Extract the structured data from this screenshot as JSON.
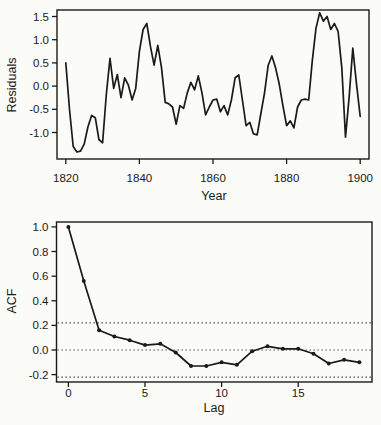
{
  "figure": {
    "background": "#fbfbf8",
    "ink_color": "#1a1a1a"
  },
  "chart_data": [
    {
      "type": "line",
      "panel": "top",
      "title": "",
      "xlabel": "Year",
      "ylabel": "Residuals",
      "x_start": 1820,
      "x_step": 1,
      "x_end": 1900,
      "values": [
        0.5,
        -0.5,
        -1.3,
        -1.42,
        -1.4,
        -1.25,
        -0.88,
        -0.63,
        -0.68,
        -1.15,
        -1.22,
        -0.18,
        0.6,
        -0.05,
        0.25,
        -0.25,
        0.18,
        0.02,
        -0.3,
        -0.05,
        0.75,
        1.22,
        1.35,
        0.85,
        0.45,
        0.88,
        0.4,
        -0.35,
        -0.38,
        -0.45,
        -0.82,
        -0.42,
        -0.48,
        -0.15,
        0.08,
        -0.08,
        0.22,
        -0.15,
        -0.62,
        -0.45,
        -0.3,
        -0.28,
        -0.55,
        -0.42,
        -0.62,
        -0.3,
        0.18,
        0.24,
        -0.3,
        -0.85,
        -0.78,
        -1.03,
        -1.05,
        -0.6,
        -0.15,
        0.45,
        0.65,
        0.4,
        0.05,
        -0.42,
        -0.85,
        -0.75,
        -0.9,
        -0.45,
        -0.3,
        -0.28,
        -0.3,
        0.55,
        1.25,
        1.58,
        1.4,
        1.5,
        1.22,
        1.35,
        1.18,
        0.4,
        -1.1,
        -0.25,
        0.82,
        0.05,
        -0.65
      ],
      "xticks": [
        1820,
        1840,
        1860,
        1880,
        1900
      ],
      "xtick_labels": [
        "1820",
        "1840",
        "1860",
        "1880",
        "1900"
      ],
      "yticks": [
        -1.0,
        -0.5,
        0.0,
        0.5,
        1.0,
        1.5
      ],
      "ytick_labels": [
        "-1.0",
        "-0.5",
        "0.0",
        "0.5",
        "1.0",
        "1.5"
      ],
      "xlim": [
        1817.6,
        1902.4
      ],
      "ylim": [
        -1.57,
        1.64
      ],
      "grid": false,
      "markers": false,
      "legend": null
    },
    {
      "type": "line",
      "panel": "bottom",
      "title": "",
      "xlabel": "Lag",
      "ylabel": "ACF",
      "x_start": 0,
      "x_step": 1,
      "x_end": 19,
      "values": [
        1.0,
        0.56,
        0.16,
        0.11,
        0.08,
        0.04,
        0.05,
        -0.02,
        -0.13,
        -0.13,
        -0.1,
        -0.12,
        -0.01,
        0.03,
        0.01,
        0.01,
        -0.03,
        -0.11,
        -0.08,
        -0.1
      ],
      "xticks": [
        0,
        5,
        10,
        15
      ],
      "xtick_labels": [
        "0",
        "5",
        "10",
        "15"
      ],
      "yticks": [
        -0.2,
        0.0,
        0.2,
        0.4,
        0.6,
        0.8,
        1.0
      ],
      "ytick_labels": [
        "-0.2",
        "0.0",
        "0.2",
        "0.4",
        "0.6",
        "0.8",
        "1.0"
      ],
      "xlim": [
        -0.78,
        19.82
      ],
      "ylim": [
        -0.26,
        1.04
      ],
      "reference_lines": {
        "style": "dotted",
        "values": [
          0.22,
          0.0,
          -0.22
        ],
        "meaning": "zero line and approximate 95% confidence bounds"
      },
      "grid": false,
      "markers": true,
      "legend": null
    }
  ]
}
